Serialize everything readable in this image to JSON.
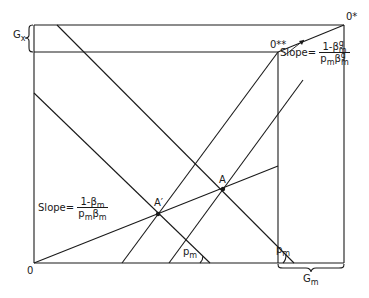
{
  "diagram": {
    "type": "edgeworth-box-style economic diagram",
    "labels": {
      "origin": "0",
      "origin_star": "0*",
      "origin_double_star": "0**",
      "gx": "G",
      "gx_sub": "x",
      "gm": "G",
      "gm_sub": "m",
      "point_a": "A",
      "point_a_prime": "A′",
      "pm_angle_1": "p",
      "pm_angle_1_sub": "m",
      "pm_angle_2": "p",
      "pm_angle_2_sub": "m"
    },
    "slope_left": {
      "prefix": "Slope=",
      "numerator": "1-β",
      "numerator_sub": "m",
      "denominator_p": "p",
      "denominator_p_sub": "m",
      "denominator_beta": "β",
      "denominator_beta_sub": "m"
    },
    "slope_right": {
      "prefix": "Slope=",
      "numerator": "1-β",
      "numerator_sup": "g",
      "numerator_sub": "m",
      "denominator_p": "p",
      "denominator_p_sub": "m",
      "denominator_beta": "β",
      "denominator_beta_sup": "g",
      "denominator_beta_sub": "m"
    },
    "colors": {
      "line": "#1a1a1a",
      "background": "#ffffff"
    }
  }
}
